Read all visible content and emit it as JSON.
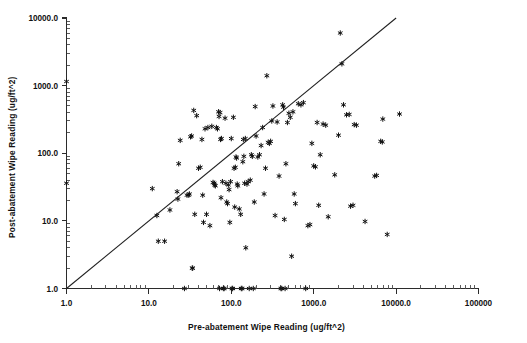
{
  "figure": {
    "background_color": "#ffffff",
    "ink_color": "#111111",
    "width": 527,
    "height": 343
  },
  "chart_data": {
    "type": "scatter",
    "title": "",
    "subtitle": "",
    "xlabel": "Pre-abatement Wipe Reading (ug/ft^2)",
    "ylabel": "Post-abatement Wipe Reading (ug/ft^2)",
    "xscale": "log",
    "yscale": "log",
    "xlim": [
      1.0,
      100000.0
    ],
    "ylim": [
      1.0,
      10000.0
    ],
    "grid": false,
    "legend": null,
    "marker": "asterisk",
    "marker_color": "#111111",
    "xticklabels": [
      "1.0",
      "10.0",
      "100.0",
      "1000.0",
      "10000.0",
      "100000"
    ],
    "xtickvalues": [
      1,
      10,
      100,
      1000,
      10000,
      100000
    ],
    "yticklabels": [
      "10000.0",
      "1000.0",
      "100.0",
      "10.0",
      "1.0"
    ],
    "ytickvalues": [
      10000,
      1000,
      100,
      10,
      1
    ],
    "minor_ticks": true,
    "annotations": [
      {
        "name": "identity-reference-line",
        "kind": "line",
        "description": "1:1 diagonal reference line y = x",
        "from": [
          1.0,
          1.0
        ],
        "to": [
          10000.0,
          10000.0
        ]
      }
    ],
    "series": [
      {
        "name": "Wipe readings",
        "marker": "asterisk",
        "points": [
          [
            1.0,
            1150.0
          ],
          [
            1.0,
            36.0
          ],
          [
            11.0,
            30.0
          ],
          [
            12.5,
            12.0
          ],
          [
            13.0,
            5.0
          ],
          [
            15.5,
            5.0
          ],
          [
            18.0,
            14.5
          ],
          [
            22.0,
            27.0
          ],
          [
            22.5,
            21.0
          ],
          [
            23.0,
            70.0
          ],
          [
            24.0,
            155.0
          ],
          [
            27.0,
            1.0
          ],
          [
            29.0,
            24.0
          ],
          [
            30.5,
            24.0
          ],
          [
            31.0,
            25.0
          ],
          [
            32.0,
            175.0
          ],
          [
            33.0,
            180.0
          ],
          [
            33.5,
            2.0
          ],
          [
            34.0,
            2.0
          ],
          [
            35.0,
            430.0
          ],
          [
            36.0,
            12.5
          ],
          [
            38.0,
            360.0
          ],
          [
            40.0,
            60.0
          ],
          [
            42.0,
            62.0
          ],
          [
            44.0,
            160.0
          ],
          [
            45.0,
            24.0
          ],
          [
            46.0,
            9.5
          ],
          [
            48.0,
            230.0
          ],
          [
            50.0,
            12.5
          ],
          [
            52.0,
            240.0
          ],
          [
            55.0,
            8.5
          ],
          [
            58.0,
            250.0
          ],
          [
            60.0,
            37.0
          ],
          [
            62.0,
            36.0
          ],
          [
            63.0,
            34.0
          ],
          [
            64.0,
            33.0
          ],
          [
            66.0,
            240.0
          ],
          [
            68.0,
            230.0
          ],
          [
            70.0,
            410.0
          ],
          [
            71.0,
            350.0
          ],
          [
            72.0,
            1.0
          ],
          [
            73.0,
            400.0
          ],
          [
            74.0,
            160.0
          ],
          [
            75.0,
            22.0
          ],
          [
            76.0,
            165.0
          ],
          [
            78.0,
            38.0
          ],
          [
            80.0,
            1.0
          ],
          [
            82.0,
            1.0
          ],
          [
            84.0,
            330.0
          ],
          [
            86.0,
            36.0
          ],
          [
            88.0,
            19.0
          ],
          [
            90.0,
            18.0
          ],
          [
            92.0,
            34.0
          ],
          [
            94.0,
            29.0
          ],
          [
            96.0,
            9.5
          ],
          [
            98.0,
            38.0
          ],
          [
            100.0,
            165.0
          ],
          [
            102.0,
            1.0
          ],
          [
            104.0,
            1.0
          ],
          [
            106.0,
            340.0
          ],
          [
            108.0,
            60.0
          ],
          [
            110.0,
            16.0
          ],
          [
            112.0,
            62.0
          ],
          [
            114.0,
            88.0
          ],
          [
            116.0,
            85.0
          ],
          [
            118.0,
            35.0
          ],
          [
            120.0,
            33.0
          ],
          [
            125.0,
            15.0
          ],
          [
            130.0,
            12.5
          ],
          [
            132.0,
            1.0
          ],
          [
            135.0,
            1.0
          ],
          [
            138.0,
            75.0
          ],
          [
            140.0,
            160.0
          ],
          [
            142.0,
            90.0
          ],
          [
            145.0,
            36.0
          ],
          [
            148.0,
            165.0
          ],
          [
            150.0,
            4.0
          ],
          [
            155.0,
            35.0
          ],
          [
            160.0,
            38.0
          ],
          [
            165.0,
            1.0
          ],
          [
            170.0,
            40.0
          ],
          [
            175.0,
            95.0
          ],
          [
            180.0,
            90.0
          ],
          [
            185.0,
            1.0
          ],
          [
            190.0,
            19.0
          ],
          [
            195.0,
            490.0
          ],
          [
            200.0,
            180.0
          ],
          [
            210.0,
            88.0
          ],
          [
            220.0,
            95.0
          ],
          [
            230.0,
            130.0
          ],
          [
            240.0,
            240.0
          ],
          [
            250.0,
            25.0
          ],
          [
            260.0,
            60.0
          ],
          [
            270.0,
            1400.0
          ],
          [
            280.0,
            145.0
          ],
          [
            290.0,
            140.0
          ],
          [
            300.0,
            150.0
          ],
          [
            310.0,
            300.0
          ],
          [
            320.0,
            500.0
          ],
          [
            340.0,
            12.0
          ],
          [
            360.0,
            290.0
          ],
          [
            380.0,
            46.0
          ],
          [
            400.0,
            1.0
          ],
          [
            410.0,
            1.0
          ],
          [
            420.0,
            520.0
          ],
          [
            430.0,
            480.0
          ],
          [
            440.0,
            10.5
          ],
          [
            450.0,
            1.0
          ],
          [
            460.0,
            70.0
          ],
          [
            480.0,
            285.0
          ],
          [
            500.0,
            390.0
          ],
          [
            520.0,
            340.0
          ],
          [
            540.0,
            3.0
          ],
          [
            560.0,
            410.0
          ],
          [
            580.0,
            25.0
          ],
          [
            600.0,
            18.0
          ],
          [
            650.0,
            540.0
          ],
          [
            700.0,
            520.0
          ],
          [
            750.0,
            560.0
          ],
          [
            800.0,
            1.0
          ],
          [
            850.0,
            8.5
          ],
          [
            900.0,
            8.8
          ],
          [
            950.0,
            140.0
          ],
          [
            1000.0,
            65.0
          ],
          [
            1050.0,
            63.0
          ],
          [
            1100.0,
            285.0
          ],
          [
            1150.0,
            17.0
          ],
          [
            1200.0,
            95.0
          ],
          [
            1300.0,
            270.0
          ],
          [
            1400.0,
            260.0
          ],
          [
            1500.0,
            11.5
          ],
          [
            1800.0,
            48.0
          ],
          [
            2000.0,
            185.0
          ],
          [
            2100.0,
            6000.0
          ],
          [
            2200.0,
            2100.0
          ],
          [
            2300.0,
            520.0
          ],
          [
            2500.0,
            370.0
          ],
          [
            2700.0,
            375.0
          ],
          [
            2800.0,
            16.5
          ],
          [
            3000.0,
            17.0
          ],
          [
            3100.0,
            265.0
          ],
          [
            3300.0,
            260.0
          ],
          [
            4200.0,
            9.8
          ],
          [
            5500.0,
            46.0
          ],
          [
            5800.0,
            47.0
          ],
          [
            6500.0,
            150.0
          ],
          [
            6800.0,
            147.0
          ],
          [
            6900.0,
            320.0
          ],
          [
            7800.0,
            6.3
          ],
          [
            11000.0,
            380.0
          ]
        ]
      }
    ]
  }
}
